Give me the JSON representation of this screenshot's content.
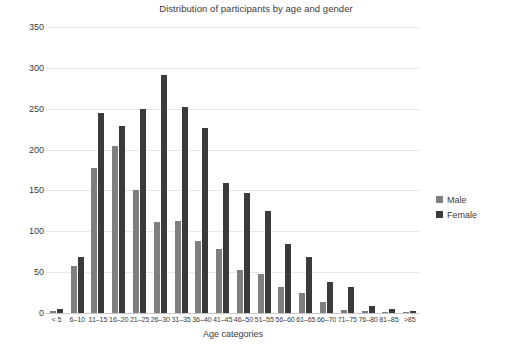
{
  "chart_data": {
    "type": "bar",
    "title": "Distribution of participants by age and gender",
    "xlabel": "Age categories",
    "ylabel": "Count",
    "ylim": [
      0,
      350
    ],
    "ytick_step": 50,
    "yticks": [
      350,
      300,
      250,
      200,
      150,
      100,
      50,
      0
    ],
    "grid": true,
    "legend_position": "right",
    "categories": [
      "< 5",
      "6–10",
      "11–15",
      "16–20",
      "21–25",
      "26–30",
      "31–35",
      "36–40",
      "41–45",
      "46–50",
      "51–55",
      "56–60",
      "61–65",
      "66–70",
      "71–75",
      "76–80",
      "81–85",
      ">85"
    ],
    "series": [
      {
        "name": "Male",
        "color": "#7f7f7f",
        "values": [
          3,
          57,
          178,
          204,
          150,
          111,
          113,
          88,
          78,
          53,
          48,
          32,
          24,
          14,
          4,
          2,
          1,
          1
        ]
      },
      {
        "name": "Female",
        "color": "#3a3a3a",
        "values": [
          5,
          68,
          245,
          229,
          250,
          291,
          252,
          227,
          159,
          147,
          125,
          84,
          69,
          38,
          32,
          9,
          5,
          3
        ]
      }
    ]
  },
  "legend": {
    "items": [
      {
        "label": "Male"
      },
      {
        "label": "Female"
      }
    ]
  }
}
